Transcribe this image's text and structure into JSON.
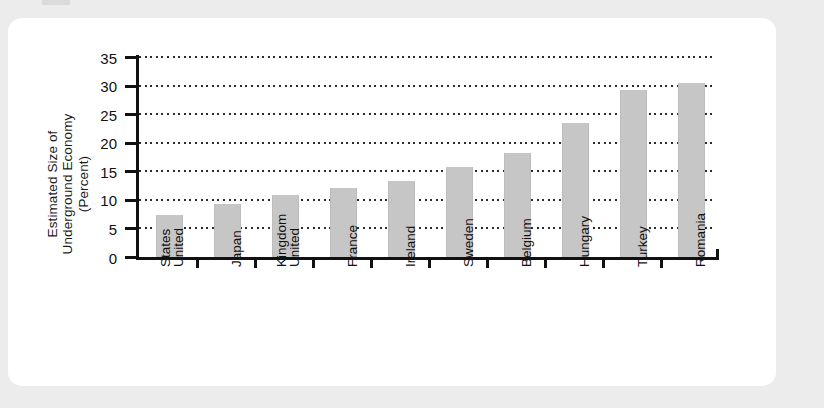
{
  "chart_data": {
    "type": "bar",
    "title": "",
    "subtitle": "",
    "xlabel": "",
    "ylabel": "Estimated Size of Underground Economy (Percent)",
    "ylabel_lines": [
      "Estimated Size of",
      "Underground Economy",
      "(Percent)"
    ],
    "ylim": [
      0,
      35
    ],
    "ytick_values": [
      0,
      5,
      10,
      15,
      20,
      25,
      30,
      35
    ],
    "ytick_labels": [
      "0",
      "5",
      "10",
      "15",
      "20",
      "25",
      "30",
      "35"
    ],
    "grid": true,
    "grid_style": "dotted-horizontal",
    "legend": "none",
    "bar_color": "#c6c6c6",
    "axis_color": "#111111",
    "background_color": "#ffffff",
    "page_background_color": "#ececec",
    "categories": [
      "United States",
      "Japan",
      "United Kingdom",
      "France",
      "Ireland",
      "Sweden",
      "Belgium",
      "Hungary",
      "Turkey",
      "Romania"
    ],
    "category_lines": [
      [
        "United",
        "States"
      ],
      [
        "Japan"
      ],
      [
        "United",
        "Kingdom"
      ],
      [
        "France"
      ],
      [
        "Ireland"
      ],
      [
        "Sweden"
      ],
      [
        "Belgium"
      ],
      [
        "Hungary"
      ],
      [
        "Turkey"
      ],
      [
        "Romania"
      ]
    ],
    "values": [
      7.4,
      9.3,
      10.9,
      12.0,
      13.3,
      15.7,
      18.2,
      23.4,
      29.2,
      30.4
    ]
  }
}
